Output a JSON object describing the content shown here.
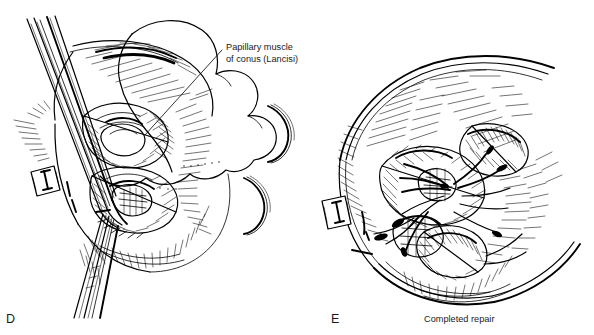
{
  "figure": {
    "kind": "surgical-illustration",
    "background_color": "#ffffff",
    "ink_color": "#000000",
    "panels": [
      {
        "id": "D",
        "letter": "D",
        "caption": "",
        "annotation_label": "Papillary muscle\nof conus (Lancisi)",
        "annotation_line1": "Papillary muscle",
        "annotation_line2": "of conus (Lancisi)"
      },
      {
        "id": "E",
        "letter": "E",
        "caption": "Completed repair",
        "annotation_label": "",
        "annotation_line1": "",
        "annotation_line2": ""
      }
    ]
  },
  "panel_d": {
    "letter": "D",
    "annotation": {
      "line1": "Papillary muscle",
      "line2": "of conus (Lancisi)"
    },
    "elements": {
      "instrument": "forceps-retractor",
      "pledget": "pledget-marker",
      "patch": "patch-outline",
      "needles": "curved-suture-needles"
    }
  },
  "panel_e": {
    "letter": "E",
    "caption": "Completed repair",
    "elements": {
      "pledget": "pledget-marker",
      "sutures": "completed-sutures",
      "chamber": "ventricular-chamber-outline"
    }
  }
}
